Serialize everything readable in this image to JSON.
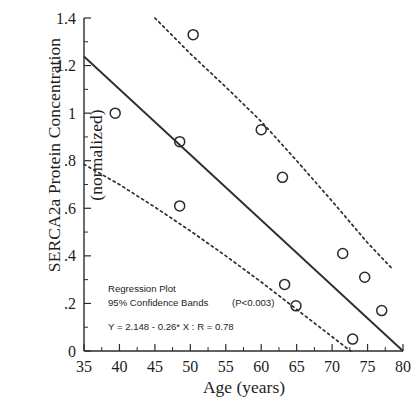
{
  "chart_data": {
    "type": "scatter",
    "title": "",
    "xlabel": "Age (years)",
    "ylabel_line1": "SERCA2a Protein Concentration",
    "ylabel_line2": "(normalized)",
    "xlim": [
      35,
      80
    ],
    "ylim": [
      0,
      1.4
    ],
    "grid": false,
    "legend": "none",
    "x_ticks": [
      35,
      40,
      45,
      50,
      55,
      60,
      65,
      70,
      75,
      80
    ],
    "x_tick_labels": [
      "35",
      "40",
      "45",
      "50",
      "55",
      "60",
      "65",
      "70",
      "75",
      "80"
    ],
    "x_minor_interval": 2.5,
    "y_ticks": [
      0,
      0.2,
      0.4,
      0.6,
      0.8,
      1.0,
      1.2,
      1.4
    ],
    "y_tick_labels": [
      "0",
      ".2",
      ".4",
      ".6",
      ".8",
      "1",
      "1.2",
      "1.4"
    ],
    "y_minor_interval": 0.1,
    "points": [
      {
        "x": 39.4,
        "y": 1.0
      },
      {
        "x": 48.5,
        "y": 0.88
      },
      {
        "x": 48.5,
        "y": 0.61
      },
      {
        "x": 50.4,
        "y": 1.33
      },
      {
        "x": 60.0,
        "y": 0.93
      },
      {
        "x": 63.0,
        "y": 0.73
      },
      {
        "x": 63.3,
        "y": 0.28
      },
      {
        "x": 64.9,
        "y": 0.19
      },
      {
        "x": 71.5,
        "y": 0.41
      },
      {
        "x": 72.9,
        "y": 0.05
      },
      {
        "x": 74.6,
        "y": 0.31
      },
      {
        "x": 77.0,
        "y": 0.17
      }
    ],
    "regression": {
      "equation": "Y = 2.148 - 0.26* X : R = 0.78",
      "intercept": 2.148,
      "slope": -0.26,
      "r": 0.78,
      "x_start": 35,
      "x_end": 80,
      "y_start": 1.238,
      "y_end": 0.0
    },
    "confidence_bands": {
      "level": "95%",
      "upper": [
        {
          "x": 45.0,
          "y": 1.4
        },
        {
          "x": 50.0,
          "y": 1.25
        },
        {
          "x": 55.0,
          "y": 1.11
        },
        {
          "x": 60.0,
          "y": 0.965
        },
        {
          "x": 65.0,
          "y": 0.8
        },
        {
          "x": 70.0,
          "y": 0.63
        },
        {
          "x": 75.0,
          "y": 0.455
        },
        {
          "x": 78.5,
          "y": 0.345
        }
      ],
      "lower": [
        {
          "x": 35.0,
          "y": 0.785
        },
        {
          "x": 40.0,
          "y": 0.7
        },
        {
          "x": 45.0,
          "y": 0.605
        },
        {
          "x": 50.0,
          "y": 0.505
        },
        {
          "x": 55.0,
          "y": 0.4
        },
        {
          "x": 60.0,
          "y": 0.29
        },
        {
          "x": 65.0,
          "y": 0.175
        },
        {
          "x": 70.0,
          "y": 0.06
        },
        {
          "x": 72.6,
          "y": 0.0
        }
      ]
    },
    "annotations": {
      "line1": "Regression Plot",
      "line2": "95% Confidence Bands",
      "pvalue": "(P<0.003)",
      "line3": "Y = 2.148 - 0.26* X : R = 0.78"
    }
  }
}
